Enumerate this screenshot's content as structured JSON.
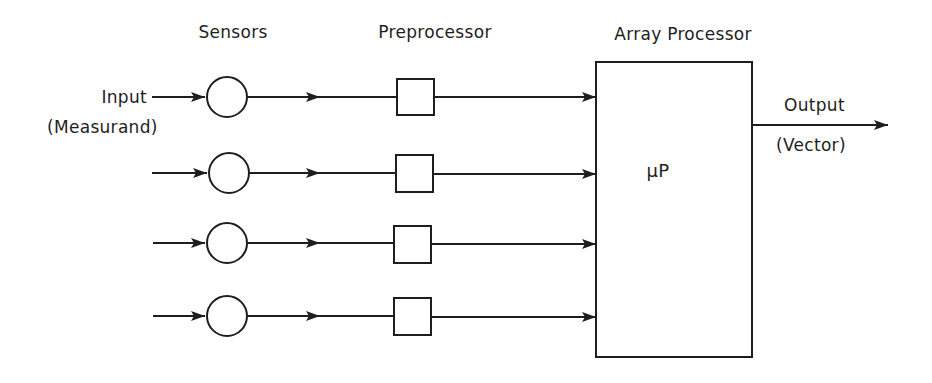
{
  "headers": {
    "sensors": "Sensors",
    "preprocessor": "Preprocessor",
    "array_processor": "Array Processor"
  },
  "input": {
    "label": "Input",
    "sublabel": "(Measurand)"
  },
  "output": {
    "label": "Output",
    "sublabel": "(Vector)"
  },
  "processor": {
    "label": "μP"
  },
  "channels": [
    {
      "id": 1,
      "y": 97
    },
    {
      "id": 2,
      "y": 173
    },
    {
      "id": 3,
      "y": 244
    },
    {
      "id": 4,
      "y": 317
    }
  ],
  "colors": {
    "stroke": "#1e1e1e",
    "background": "#ffffff"
  }
}
